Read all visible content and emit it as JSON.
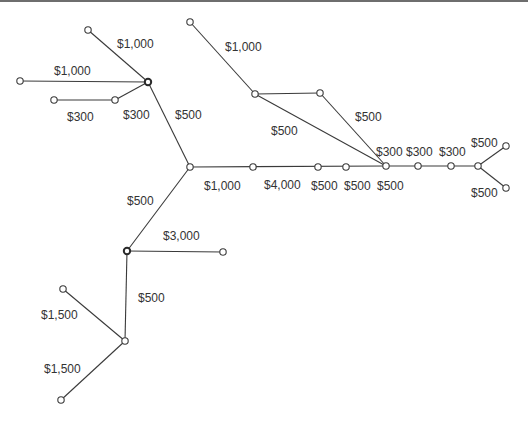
{
  "diagram": {
    "type": "network-tree",
    "nodes": [
      {
        "id": "n1",
        "x": 88,
        "y": 30
      },
      {
        "id": "n2",
        "x": 20,
        "y": 81
      },
      {
        "id": "hubA",
        "x": 148,
        "y": 82,
        "hub": true
      },
      {
        "id": "n4",
        "x": 54,
        "y": 100
      },
      {
        "id": "n5",
        "x": 115,
        "y": 100
      },
      {
        "id": "n6",
        "x": 190,
        "y": 22
      },
      {
        "id": "n7",
        "x": 255,
        "y": 94
      },
      {
        "id": "n8",
        "x": 320,
        "y": 93
      },
      {
        "id": "hubB",
        "x": 190,
        "y": 167
      },
      {
        "id": "n10",
        "x": 253,
        "y": 167
      },
      {
        "id": "n11",
        "x": 318,
        "y": 167
      },
      {
        "id": "n12",
        "x": 346,
        "y": 167
      },
      {
        "id": "hubC",
        "x": 386,
        "y": 166
      },
      {
        "id": "n14",
        "x": 418,
        "y": 166
      },
      {
        "id": "n15",
        "x": 451,
        "y": 166
      },
      {
        "id": "n16",
        "x": 478,
        "y": 166
      },
      {
        "id": "n17",
        "x": 506,
        "y": 146
      },
      {
        "id": "n18",
        "x": 506,
        "y": 188
      },
      {
        "id": "hubD",
        "x": 127,
        "y": 251,
        "hub": true
      },
      {
        "id": "n20",
        "x": 223,
        "y": 252
      },
      {
        "id": "n21",
        "x": 125,
        "y": 341
      },
      {
        "id": "n22",
        "x": 63,
        "y": 289
      },
      {
        "id": "n23",
        "x": 61,
        "y": 400
      }
    ],
    "edges": [
      {
        "from": "n1",
        "to": "hubA"
      },
      {
        "from": "n2",
        "to": "hubA"
      },
      {
        "from": "n4",
        "to": "n5"
      },
      {
        "from": "n5",
        "to": "hubA"
      },
      {
        "from": "hubA",
        "to": "hubB"
      },
      {
        "from": "n6",
        "to": "n7"
      },
      {
        "from": "n7",
        "to": "n8"
      },
      {
        "from": "n7",
        "to": "hubC"
      },
      {
        "from": "n8",
        "to": "hubC"
      },
      {
        "from": "hubB",
        "to": "hubC"
      },
      {
        "from": "hubC",
        "to": "n16"
      },
      {
        "from": "n16",
        "to": "n17"
      },
      {
        "from": "n16",
        "to": "n18"
      },
      {
        "from": "hubB",
        "to": "hubD"
      },
      {
        "from": "hubD",
        "to": "n20"
      },
      {
        "from": "hubD",
        "to": "n21"
      },
      {
        "from": "n21",
        "to": "n22"
      },
      {
        "from": "n21",
        "to": "n23"
      }
    ],
    "labels": [
      {
        "text": "$1,000",
        "x": 117,
        "y": 48
      },
      {
        "text": "$1,000",
        "x": 54,
        "y": 75
      },
      {
        "text": "$300",
        "x": 67,
        "y": 121
      },
      {
        "text": "$300",
        "x": 123,
        "y": 119
      },
      {
        "text": "$500",
        "x": 175,
        "y": 119
      },
      {
        "text": "$1,000",
        "x": 225,
        "y": 51
      },
      {
        "text": "$500",
        "x": 355,
        "y": 121
      },
      {
        "text": "$500",
        "x": 271,
        "y": 135
      },
      {
        "text": "$300",
        "x": 376,
        "y": 156
      },
      {
        "text": "$300",
        "x": 406,
        "y": 156
      },
      {
        "text": "$300",
        "x": 439,
        "y": 156
      },
      {
        "text": "$500",
        "x": 471,
        "y": 147
      },
      {
        "text": "$500",
        "x": 471,
        "y": 197
      },
      {
        "text": "$1,000",
        "x": 204,
        "y": 190
      },
      {
        "text": "$4,000",
        "x": 264,
        "y": 189
      },
      {
        "text": "$500",
        "x": 311,
        "y": 190
      },
      {
        "text": "$500",
        "x": 344,
        "y": 190
      },
      {
        "text": "$500",
        "x": 377,
        "y": 190
      },
      {
        "text": "$500",
        "x": 127,
        "y": 205
      },
      {
        "text": "$3,000",
        "x": 163,
        "y": 240
      },
      {
        "text": "$500",
        "x": 138,
        "y": 302
      },
      {
        "text": "$1,500",
        "x": 41,
        "y": 319
      },
      {
        "text": "$1,500",
        "x": 44,
        "y": 373
      }
    ]
  }
}
